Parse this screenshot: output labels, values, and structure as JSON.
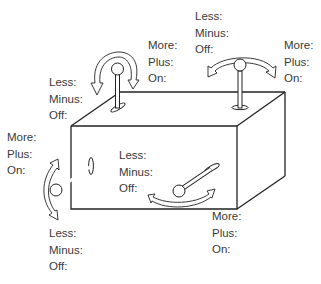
{
  "diagram": {
    "levers": [
      {
        "id": "top-left",
        "orientation": "vertical lever on top surface, rotates left-right (front-back view)",
        "decrease_labels": [
          "Less:",
          "Minus:",
          "Off:"
        ],
        "increase_labels": [
          "More:",
          "Plus:",
          "On:"
        ]
      },
      {
        "id": "top-right",
        "orientation": "vertical lever on top surface, rotates left-right",
        "decrease_labels": [
          "Less:",
          "Minus:",
          "Off:"
        ],
        "increase_labels": [
          "More:",
          "Plus:",
          "On:"
        ]
      },
      {
        "id": "left-side",
        "orientation": "lever on front face, swings up-down",
        "increase_labels": [
          "More:",
          "Plus:",
          "On:"
        ],
        "decrease_labels": [
          "Less:",
          "Minus:",
          "Off:"
        ]
      },
      {
        "id": "front",
        "orientation": "lever on front face, swings left-right",
        "decrease_labels": [
          "Less:",
          "Minus:",
          "Off:"
        ],
        "increase_labels": [
          "More:",
          "Plus:",
          "On:"
        ]
      }
    ]
  }
}
